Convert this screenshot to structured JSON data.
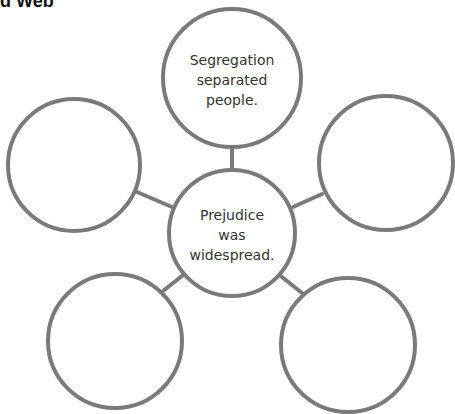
{
  "title": "d Web",
  "colors": {
    "stroke": "#7a7a7a",
    "text": "#333333",
    "background": "#ffffff"
  },
  "web": {
    "center": {
      "text_lines": [
        "Prejudice",
        "was",
        "widespread."
      ]
    },
    "nodes": [
      {
        "position": "top",
        "text_lines": [
          "Segregation",
          "separated",
          "people."
        ]
      },
      {
        "position": "left",
        "text_lines": []
      },
      {
        "position": "right",
        "text_lines": []
      },
      {
        "position": "bottom-left",
        "text_lines": []
      },
      {
        "position": "bottom-right",
        "text_lines": []
      }
    ]
  }
}
